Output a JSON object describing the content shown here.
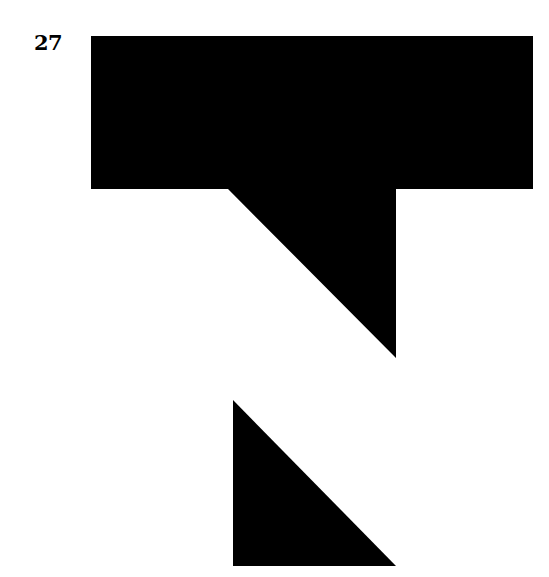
{
  "figure": {
    "label": "27",
    "background_color": "#ffffff",
    "ink_color": "#000000",
    "canvas": {
      "width": 549,
      "height": 577
    },
    "label_position": {
      "x": 34,
      "y": 30
    },
    "shapes": [
      {
        "name": "notched-flag-shape",
        "type": "polygon",
        "fill": "#000000",
        "points": "91,36 533,36 533,189 396,189 396,358 228,189 91,189"
      },
      {
        "name": "lower-right-triangle",
        "type": "polygon",
        "fill": "#000000",
        "points": "233,400 396,566 233,566"
      }
    ]
  }
}
